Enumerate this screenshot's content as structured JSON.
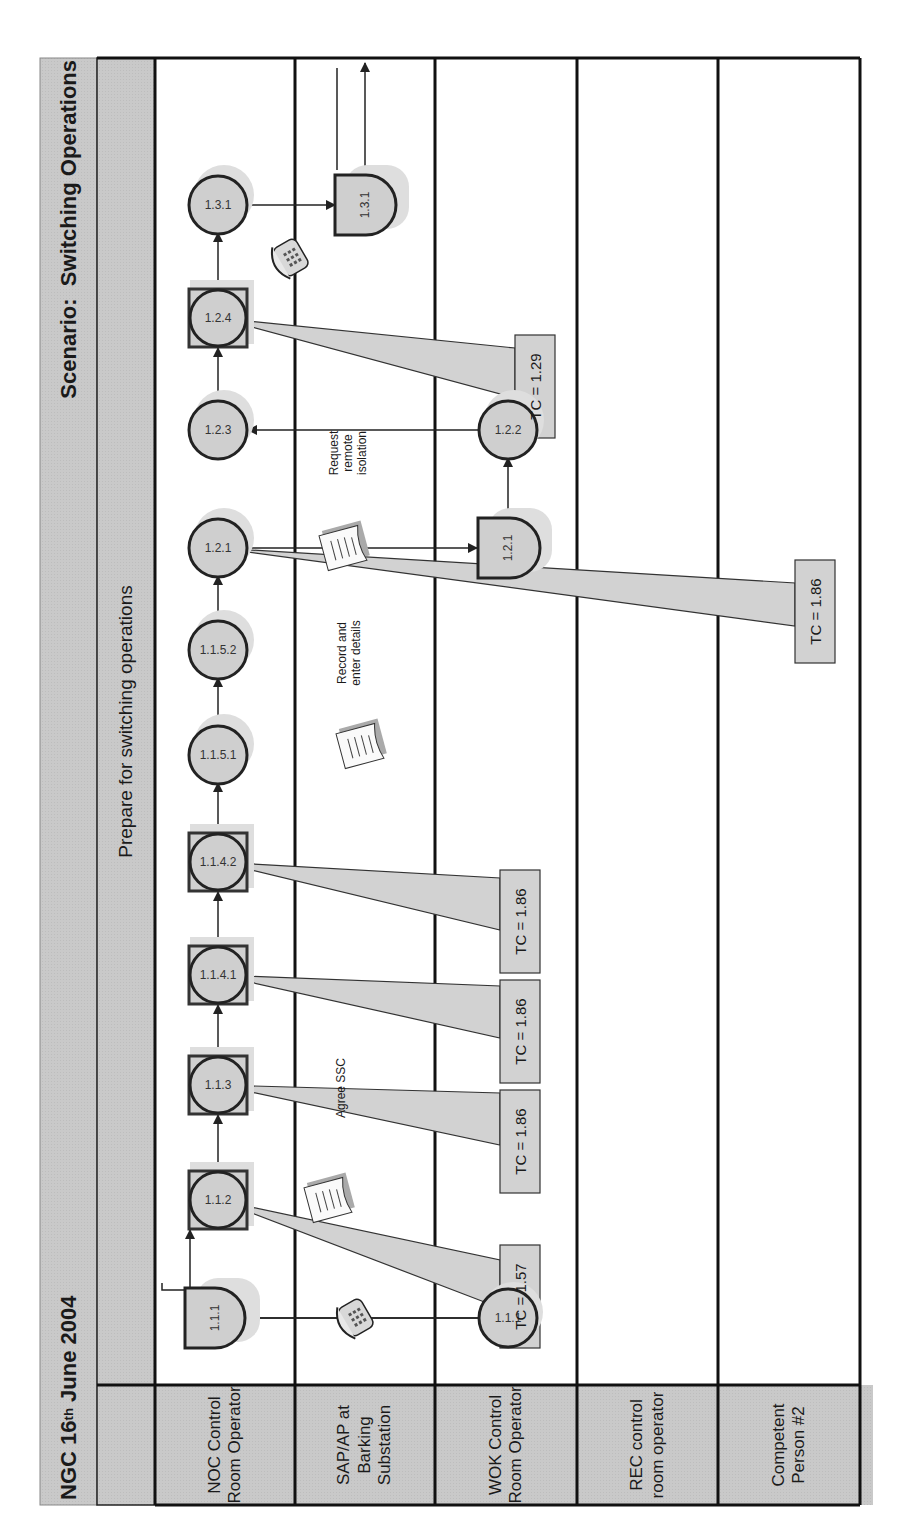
{
  "header": {
    "title_prefix": "NGC 16",
    "title_sup": "th",
    "title_suffix": " June 2004",
    "scenario": "Scenario:  Switching Operations",
    "phase": "Prepare for switching operations"
  },
  "lanes": [
    {
      "label": "NOC Control Room Operator"
    },
    {
      "label": "SAP/AP at Barking Substation"
    },
    {
      "label": "WOK Control Room Operator"
    },
    {
      "label": "REC control room operator"
    },
    {
      "label": "Competent Person #2"
    }
  ],
  "nodes": [
    {
      "id": "1.1.1",
      "lane": "NOC",
      "shape": "delay"
    },
    {
      "id": "1.1.1",
      "lane": "WOK",
      "shape": "circle"
    },
    {
      "id": "1.1.2",
      "lane": "NOC",
      "shape": "boxed-circle"
    },
    {
      "id": "1.1.3",
      "lane": "NOC",
      "shape": "boxed-circle"
    },
    {
      "id": "1.1.4.1",
      "lane": "NOC",
      "shape": "boxed-circle"
    },
    {
      "id": "1.1.4.2",
      "lane": "NOC",
      "shape": "boxed-circle"
    },
    {
      "id": "1.1.5.1",
      "lane": "NOC",
      "shape": "circle"
    },
    {
      "id": "1.1.5.2",
      "lane": "NOC",
      "shape": "circle"
    },
    {
      "id": "1.2.1",
      "lane": "NOC",
      "shape": "circle"
    },
    {
      "id": "1.2.1",
      "lane": "WOK",
      "shape": "delay"
    },
    {
      "id": "1.2.2",
      "lane": "WOK",
      "shape": "circle"
    },
    {
      "id": "1.2.3",
      "lane": "NOC",
      "shape": "circle"
    },
    {
      "id": "1.2.4",
      "lane": "NOC",
      "shape": "boxed-circle"
    },
    {
      "id": "1.3.1",
      "lane": "NOC",
      "shape": "circle"
    },
    {
      "id": "1.3.1",
      "lane": "SAP",
      "shape": "delay"
    }
  ],
  "annotations": {
    "agree_ssc": "Agree SSC",
    "record_details_1": "Record and",
    "record_details_2": "enter details",
    "request_1": "Request",
    "request_2": "remote",
    "request_3": "isolation"
  },
  "callouts": [
    {
      "node": "1.1.2",
      "text": "TC = 1.57"
    },
    {
      "node": "1.1.3",
      "text": "TC = 1.86"
    },
    {
      "node": "1.1.4.1",
      "text": "TC = 1.86"
    },
    {
      "node": "1.1.4.2",
      "text": "TC = 1.86"
    },
    {
      "node": "1.2.1",
      "text": "TC = 1.86"
    },
    {
      "node": "1.2.4",
      "text": "TC = 1.29"
    }
  ],
  "icons": {
    "phone": "telephone-icon",
    "document": "document-icon"
  },
  "colors": {
    "band": "#c8c8c8",
    "node_fill": "#cfcfcf",
    "stroke": "#222222",
    "shadow": "#dcdcdc"
  }
}
